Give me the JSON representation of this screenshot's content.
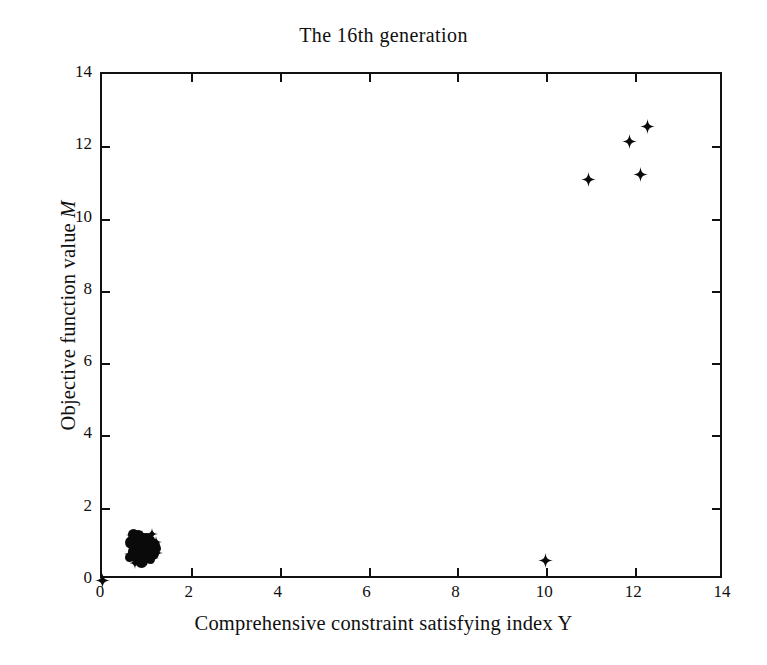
{
  "chart_data": {
    "type": "scatter",
    "title": "The 16th generation",
    "xlabel": "Comprehensive constraint satisfying index Y",
    "xlabel_symbol": "Y",
    "ylabel": "Objective function value M",
    "ylabel_symbol": "M",
    "xlim": [
      0,
      14
    ],
    "ylim": [
      0,
      14
    ],
    "xticks": [
      0,
      2,
      4,
      6,
      8,
      10,
      12,
      14
    ],
    "yticks": [
      0,
      2,
      4,
      6,
      8,
      10,
      12,
      14
    ],
    "xtick_labels": [
      "0",
      "2",
      "4",
      "6",
      "8",
      "10",
      "12",
      "14"
    ],
    "ytick_labels": [
      "0",
      "2",
      "4",
      "6",
      "8",
      "10",
      "12",
      "14"
    ],
    "grid": false,
    "legend": null,
    "marker_style": "four-pointed-star",
    "marker_color": "#0a0a0a",
    "series": [
      {
        "name": "population",
        "points": [
          [
            0.0,
            0.0
          ],
          [
            9.99,
            0.55
          ],
          [
            10.96,
            11.09
          ],
          [
            11.88,
            12.12
          ],
          [
            12.13,
            11.23
          ],
          [
            12.27,
            12.56
          ],
          [
            0.62,
            0.72
          ],
          [
            0.66,
            0.95
          ],
          [
            0.7,
            0.6
          ],
          [
            0.72,
            1.08
          ],
          [
            0.75,
            0.84
          ],
          [
            0.78,
            0.68
          ],
          [
            0.8,
            1.18
          ],
          [
            0.82,
            0.92
          ],
          [
            0.84,
            0.55
          ],
          [
            0.86,
            1.02
          ],
          [
            0.88,
            0.78
          ],
          [
            0.9,
            1.22
          ],
          [
            0.92,
            0.66
          ],
          [
            0.94,
            0.96
          ],
          [
            0.96,
            0.82
          ],
          [
            0.98,
            1.1
          ],
          [
            1.0,
            0.7
          ],
          [
            1.02,
            0.9
          ],
          [
            1.05,
            1.15
          ],
          [
            1.08,
            0.76
          ],
          [
            1.1,
            1.0
          ],
          [
            1.14,
            0.62
          ],
          [
            1.18,
            0.88
          ],
          [
            1.22,
            1.05
          ],
          [
            0.68,
            1.25
          ],
          [
            0.74,
            0.48
          ],
          [
            1.12,
            1.28
          ],
          [
            1.24,
            0.74
          ]
        ]
      }
    ],
    "cluster_note": "Dense overlapping cluster near (0.6-1.3, 0.5-1.3) rendered as a solid blob"
  },
  "figure": {
    "background_color": "#ffffff",
    "axis_color": "#111111"
  }
}
